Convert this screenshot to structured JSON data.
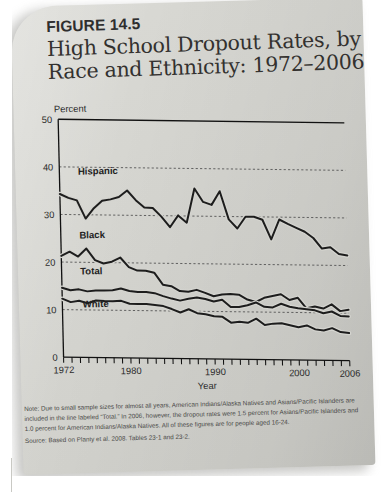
{
  "figure": {
    "number": "FIGURE 14.5",
    "title_line1": "High School Dropout Rates, by",
    "title_line2": "Race and Ethnicity: 1972–2006"
  },
  "notes": {
    "note": "Note: Due to small sample sizes for almost all years, American Indians/Alaska Natives and Asians/Pacific Islanders are included in the line labeled “Total.” In 2006, however, the dropout rates were 1.5 percent for Asians/Pacific Islanders and 1.0 percent for American Indians/Alaska Natives. All of these figures are for people aged 16-24.",
    "source": "Source: Based on Planty et al. 2008. Tables 23-1 and 23-2."
  },
  "chart_data": {
    "type": "line",
    "title": "High School Dropout Rates, by Race and Ethnicity: 1972–2006",
    "xlabel": "Year",
    "ylabel": "Percent",
    "ylim": [
      0,
      50
    ],
    "ytick_labels": [
      "0",
      "10",
      "20",
      "30",
      "40",
      "50"
    ],
    "yticks": [
      0,
      10,
      20,
      30,
      40,
      50
    ],
    "xlim": [
      1972,
      2006
    ],
    "xtick_labels": [
      "1972",
      "1980",
      "1990",
      "2000",
      "2006"
    ],
    "xticks": [
      1972,
      1980,
      1990,
      2000,
      2006
    ],
    "grid": "horizontal-dotted",
    "legend": "inline-labels",
    "x": [
      1972,
      1973,
      1974,
      1975,
      1976,
      1977,
      1978,
      1979,
      1980,
      1981,
      1982,
      1983,
      1984,
      1985,
      1986,
      1987,
      1988,
      1989,
      1990,
      1991,
      1992,
      1993,
      1994,
      1995,
      1996,
      1997,
      1998,
      1999,
      2000,
      2001,
      2002,
      2003,
      2004,
      2005,
      2006
    ],
    "series": [
      {
        "name": "Hispanic",
        "label": "Hispanic",
        "values": [
          34.3,
          33.5,
          33.0,
          29.2,
          31.4,
          33.0,
          33.3,
          33.8,
          35.2,
          33.2,
          31.7,
          31.6,
          29.8,
          27.6,
          30.1,
          28.6,
          35.8,
          33.0,
          32.4,
          35.3,
          29.4,
          27.5,
          30.0,
          30.0,
          29.4,
          25.3,
          29.5,
          28.6,
          27.8,
          27.0,
          25.7,
          23.5,
          23.8,
          22.4,
          22.1
        ]
      },
      {
        "name": "Black",
        "label": "Black",
        "values": [
          21.3,
          22.2,
          21.2,
          22.9,
          20.5,
          19.8,
          20.2,
          21.1,
          19.1,
          18.4,
          18.4,
          18.0,
          15.5,
          15.2,
          14.2,
          14.1,
          14.5,
          13.9,
          13.2,
          13.6,
          13.7,
          13.6,
          12.6,
          12.1,
          13.0,
          13.4,
          13.8,
          12.6,
          13.1,
          10.9,
          11.3,
          10.9,
          11.8,
          10.4,
          10.7
        ]
      },
      {
        "name": "Total",
        "label": "Total",
        "values": [
          14.6,
          14.1,
          14.3,
          13.9,
          14.1,
          14.1,
          14.2,
          14.6,
          14.1,
          13.9,
          13.9,
          13.7,
          13.1,
          12.6,
          12.2,
          12.6,
          12.9,
          12.6,
          12.1,
          12.5,
          11.0,
          11.0,
          11.4,
          12.0,
          11.1,
          11.0,
          11.8,
          11.2,
          10.9,
          10.7,
          10.5,
          9.9,
          10.3,
          9.4,
          9.3
        ]
      },
      {
        "name": "White",
        "label": "White",
        "values": [
          12.3,
          11.6,
          11.9,
          11.4,
          12.0,
          11.9,
          11.9,
          12.0,
          11.4,
          11.4,
          11.4,
          11.2,
          11.0,
          10.4,
          9.7,
          10.4,
          9.6,
          9.4,
          9.0,
          8.9,
          7.7,
          7.9,
          7.7,
          8.6,
          7.3,
          7.6,
          7.7,
          7.3,
          6.9,
          7.3,
          6.5,
          6.3,
          6.8,
          6.0,
          5.8
        ]
      }
    ],
    "label_positions": [
      {
        "name": "Hispanic",
        "year": 1974.2,
        "value": 38.4
      },
      {
        "name": "Black",
        "year": 1974.2,
        "value": 25.0
      },
      {
        "name": "Total",
        "year": 1974.2,
        "value": 17.4
      },
      {
        "name": "White",
        "year": 1974.4,
        "value": 10.5
      }
    ],
    "colors": {
      "hispanic": "#1d1d1d",
      "black": "#1d1d1d",
      "total": "#1d1d1d",
      "white": "#1d1d1d",
      "grid": "#555555",
      "axis": "#111111",
      "plot_background": "#d4d4cf"
    }
  }
}
